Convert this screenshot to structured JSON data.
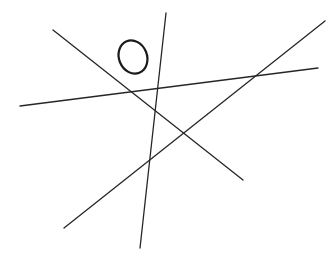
{
  "canvas": {
    "width": 336,
    "height": 262,
    "background_color": "#ffffff",
    "title": "Hand-drawn sketch of four crossing lines and an ellipse"
  },
  "style": {
    "line_color": "#262626",
    "line_width": 1.3,
    "ellipse_color": "#1a1a1a",
    "ellipse_width": 2.2
  },
  "shapes": {
    "lines": [
      {
        "name": "diagonal-descending-line",
        "description": "Long line from upper-left down to lower-right",
        "x1": 53,
        "y1": 30,
        "x2": 243,
        "y2": 180
      },
      {
        "name": "diagonal-ascending-line",
        "description": "Long line from lower-left up to upper-right",
        "x1": 64,
        "y1": 228,
        "x2": 325,
        "y2": 21
      },
      {
        "name": "steep-vertical-line",
        "description": "Near-vertical line leaning slightly, top-center to bottom-center",
        "x1": 166,
        "y1": 13,
        "x2": 140,
        "y2": 248
      },
      {
        "name": "shallow-horizontal-line",
        "description": "Nearly horizontal line rising gently from left to right",
        "x1": 20,
        "y1": 106,
        "x2": 318,
        "y2": 68
      }
    ],
    "ellipse": {
      "name": "small-ellipse",
      "description": "Small tilted open ellipse near top-left of the sketch",
      "cx": 133,
      "cy": 57,
      "rx": 14,
      "ry": 17,
      "rotation_deg": -22
    }
  }
}
